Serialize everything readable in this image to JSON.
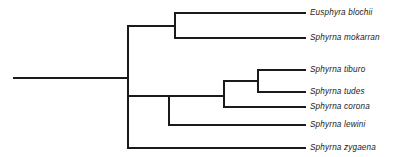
{
  "figure": {
    "type": "cladogram",
    "title": "",
    "line_color": "#1a1a1a",
    "background_color": "#ffffff",
    "line_width": 1.2
  },
  "chart_data": {
    "type": "diagram",
    "subtype": "phylogenetic-cladogram",
    "title": "",
    "xlabel": "",
    "ylabel": "",
    "grid": false,
    "legend": null,
    "taxa": [
      {
        "id": "eusphyra_blochii",
        "label": "Eusphyra blochii",
        "tip_y": 13,
        "branch_from_x": 175,
        "tip_x": 305
      },
      {
        "id": "sphyrna_mokarran",
        "label": "Sphyrna mokarran",
        "tip_y": 38,
        "branch_from_x": 175,
        "tip_x": 305
      },
      {
        "id": "sphyrna_tiburo",
        "label": "Sphyrna tiburo",
        "tip_y": 70,
        "branch_from_x": 258,
        "tip_x": 305
      },
      {
        "id": "sphyrna_tudes",
        "label": "Sphyrna tudes",
        "tip_y": 92,
        "branch_from_x": 258,
        "tip_x": 305
      },
      {
        "id": "sphyrna_corona",
        "label": "Sphyrna corona",
        "tip_y": 107,
        "branch_from_x": 224,
        "tip_x": 305
      },
      {
        "id": "sphyrna_lewini",
        "label": "Sphyrna lewini",
        "tip_y": 125,
        "branch_from_x": 169,
        "tip_x": 305
      },
      {
        "id": "sphyrna_zygaena",
        "label": "Sphyrna zygaena",
        "tip_y": 148,
        "branch_from_x": 128,
        "tip_x": 305
      }
    ],
    "nodes": [
      {
        "id": "root-stem",
        "x1": 14,
        "y1": 78,
        "x2": 128,
        "y2": 78,
        "orient": "h"
      },
      {
        "id": "root-node",
        "x": 128,
        "y_top": 26,
        "y_bottom": 148,
        "orient": "v"
      },
      {
        "id": "upper-clade-connector",
        "x1": 128,
        "y1": 26,
        "x2": 175,
        "y2": 26,
        "orient": "h"
      },
      {
        "id": "upper-clade-node",
        "x": 175,
        "y_top": 13,
        "y_bottom": 38,
        "orient": "v"
      },
      {
        "id": "lower-clade-connector",
        "x1": 128,
        "y1": 96,
        "x2": 169,
        "y2": 96,
        "orient": "h"
      },
      {
        "id": "lower-clade-node",
        "x": 169,
        "y_top": 96,
        "y_bottom": 125,
        "orient": "v"
      },
      {
        "id": "tudes-group-connector",
        "x1": 169,
        "y1": 96,
        "x2": 224,
        "y2": 96,
        "orient": "h"
      },
      {
        "id": "tudes-group-node",
        "x": 224,
        "y_top": 81,
        "y_bottom": 107,
        "orient": "v"
      },
      {
        "id": "tiburo-pair-connector",
        "x1": 224,
        "y1": 81,
        "x2": 258,
        "y2": 81,
        "orient": "h"
      },
      {
        "id": "tiburo-pair-node",
        "x": 258,
        "y_top": 70,
        "y_bottom": 92,
        "orient": "v"
      }
    ],
    "label_x": 310
  }
}
